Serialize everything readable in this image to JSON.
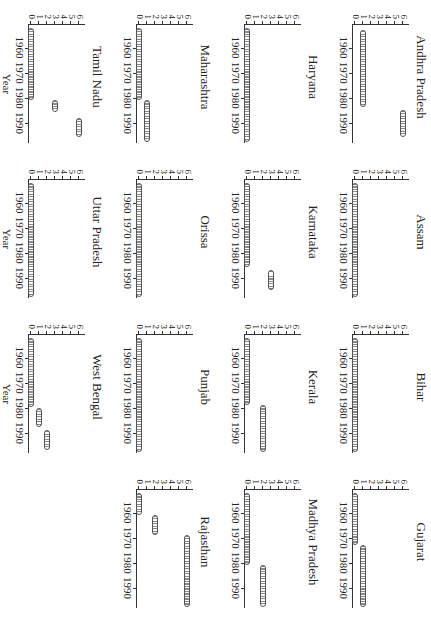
{
  "chart_data": {
    "type": "scatter",
    "title": "",
    "xlabel": "Year",
    "ylabel": "",
    "xlim": [
      1951,
      1998
    ],
    "ylim": [
      0,
      6
    ],
    "x_ticks": [
      "1960",
      "1970",
      "1980",
      "1990"
    ],
    "y_ticks": [
      "0",
      "1",
      "2",
      "3",
      "4",
      "5",
      "6"
    ],
    "layout": {
      "rows": 4,
      "cols": 4,
      "rotated": "90deg",
      "grid": false,
      "legend": "none"
    },
    "panels": [
      {
        "name": "Andhra Pradesh",
        "segments": [
          {
            "from": 1953,
            "to": 1983,
            "value": 1
          },
          {
            "from": 1985,
            "to": 1995,
            "value": 6
          }
        ]
      },
      {
        "name": "Assam",
        "segments": [
          {
            "from": 1952,
            "to": 1997,
            "value": 0
          }
        ]
      },
      {
        "name": "Bihar",
        "segments": [
          {
            "from": 1952,
            "to": 1997,
            "value": 0
          }
        ]
      },
      {
        "name": "Gujarat",
        "segments": [
          {
            "from": 1952,
            "to": 1972,
            "value": 0
          },
          {
            "from": 1973,
            "to": 1997,
            "value": 1
          }
        ]
      },
      {
        "name": "Haryana",
        "segments": [
          {
            "from": 1952,
            "to": 1997,
            "value": 0
          }
        ]
      },
      {
        "name": "Karnataka",
        "segments": [
          {
            "from": 1952,
            "to": 1985,
            "value": 0
          },
          {
            "from": 1987,
            "to": 1994,
            "value": 3
          }
        ]
      },
      {
        "name": "Kerala",
        "segments": [
          {
            "from": 1952,
            "to": 1978,
            "value": 0
          },
          {
            "from": 1979,
            "to": 1997,
            "value": 2
          }
        ]
      },
      {
        "name": "Madhya Pradesh",
        "segments": [
          {
            "from": 1952,
            "to": 1980,
            "value": 0
          },
          {
            "from": 1981,
            "to": 1997,
            "value": 2
          }
        ]
      },
      {
        "name": "Maharashtra",
        "segments": [
          {
            "from": 1952,
            "to": 1980,
            "value": 0
          },
          {
            "from": 1981,
            "to": 1997,
            "value": 1
          }
        ]
      },
      {
        "name": "Orissa",
        "segments": [
          {
            "from": 1952,
            "to": 1997,
            "value": 0
          }
        ]
      },
      {
        "name": "Punjab",
        "segments": [
          {
            "from": 1952,
            "to": 1997,
            "value": 0
          }
        ]
      },
      {
        "name": "Rajasthan",
        "segments": [
          {
            "from": 1952,
            "to": 1960,
            "value": 0
          },
          {
            "from": 1961,
            "to": 1968,
            "value": 2
          },
          {
            "from": 1969,
            "to": 1997,
            "value": 6
          }
        ]
      },
      {
        "name": "Tamil Nadu",
        "segments": [
          {
            "from": 1952,
            "to": 1980,
            "value": 0
          },
          {
            "from": 1981,
            "to": 1985,
            "value": 3
          },
          {
            "from": 1988,
            "to": 1995,
            "value": 6
          }
        ]
      },
      {
        "name": "Uttar Pradesh",
        "segments": [
          {
            "from": 1952,
            "to": 1997,
            "value": 0
          }
        ]
      },
      {
        "name": "West Bengal",
        "segments": [
          {
            "from": 1952,
            "to": 1979,
            "value": 0
          },
          {
            "from": 1980,
            "to": 1987,
            "value": 1
          },
          {
            "from": 1989,
            "to": 1996,
            "value": 2
          }
        ]
      }
    ]
  },
  "labels": {
    "year": "Year",
    "x_ticks": [
      "1960",
      "1970",
      "1980",
      "1990"
    ],
    "y_ticks": [
      "0",
      "1",
      "2",
      "3",
      "4",
      "5",
      "6"
    ]
  }
}
